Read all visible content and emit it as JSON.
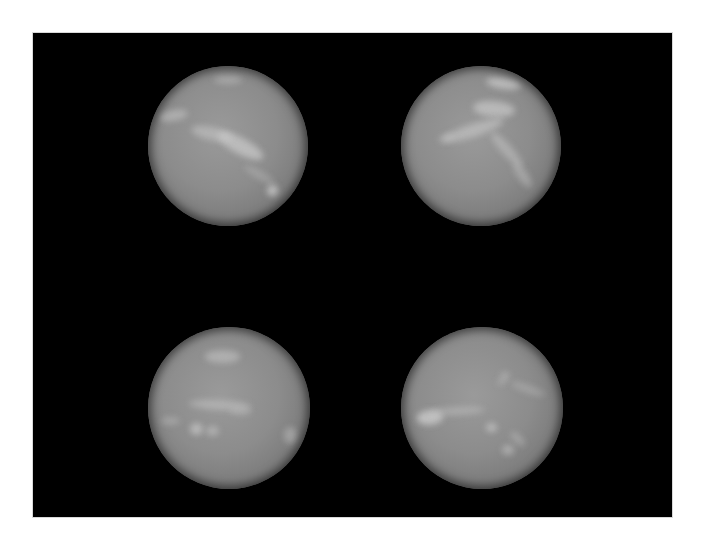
{
  "image": {
    "alt": "Four grayscale telescope images of Neptune arranged in a 2x2 grid on a black background, showing bright cloud bands and features",
    "background_color": "#ffffff",
    "panel_color": "#000000",
    "planet_base_color": "#8c8c8c",
    "feature_color": "#c8c8c8"
  },
  "panels": [
    {
      "id": "top-left",
      "cx": 228,
      "cy": 146,
      "r": 80,
      "features": [
        {
          "x": 0.58,
          "y": 0.5,
          "w": 0.32,
          "h": 0.1,
          "rot": 28,
          "o": 0.75
        },
        {
          "x": 0.4,
          "y": 0.42,
          "w": 0.26,
          "h": 0.08,
          "rot": 12,
          "o": 0.55
        },
        {
          "x": 0.16,
          "y": 0.31,
          "w": 0.18,
          "h": 0.07,
          "rot": -10,
          "o": 0.55
        },
        {
          "x": 0.5,
          "y": 0.09,
          "w": 0.18,
          "h": 0.05,
          "rot": 0,
          "o": 0.45
        },
        {
          "x": 0.78,
          "y": 0.78,
          "w": 0.07,
          "h": 0.07,
          "rot": 0,
          "o": 0.85
        },
        {
          "x": 0.7,
          "y": 0.68,
          "w": 0.22,
          "h": 0.05,
          "rot": 30,
          "o": 0.35
        }
      ]
    },
    {
      "id": "top-right",
      "cx": 481,
      "cy": 146,
      "r": 80,
      "features": [
        {
          "x": 0.64,
          "y": 0.11,
          "w": 0.22,
          "h": 0.07,
          "rot": 8,
          "o": 0.75
        },
        {
          "x": 0.58,
          "y": 0.27,
          "w": 0.26,
          "h": 0.1,
          "rot": 5,
          "o": 0.7
        },
        {
          "x": 0.45,
          "y": 0.4,
          "w": 0.4,
          "h": 0.08,
          "rot": -18,
          "o": 0.6
        },
        {
          "x": 0.66,
          "y": 0.52,
          "w": 0.28,
          "h": 0.07,
          "rot": 48,
          "o": 0.5
        },
        {
          "x": 0.76,
          "y": 0.68,
          "w": 0.18,
          "h": 0.06,
          "rot": 55,
          "o": 0.45
        },
        {
          "x": 0.28,
          "y": 0.45,
          "w": 0.1,
          "h": 0.05,
          "rot": -20,
          "o": 0.4
        }
      ]
    },
    {
      "id": "bottom-left",
      "cx": 229,
      "cy": 408,
      "r": 81,
      "features": [
        {
          "x": 0.46,
          "y": 0.18,
          "w": 0.22,
          "h": 0.08,
          "rot": 0,
          "o": 0.55
        },
        {
          "x": 0.44,
          "y": 0.48,
          "w": 0.38,
          "h": 0.06,
          "rot": 3,
          "o": 0.5
        },
        {
          "x": 0.57,
          "y": 0.52,
          "w": 0.14,
          "h": 0.05,
          "rot": 0,
          "o": 0.4
        },
        {
          "x": 0.3,
          "y": 0.63,
          "w": 0.08,
          "h": 0.07,
          "rot": 0,
          "o": 0.7
        },
        {
          "x": 0.4,
          "y": 0.64,
          "w": 0.08,
          "h": 0.06,
          "rot": 0,
          "o": 0.55
        },
        {
          "x": 0.14,
          "y": 0.58,
          "w": 0.12,
          "h": 0.05,
          "rot": 0,
          "o": 0.4
        },
        {
          "x": 0.88,
          "y": 0.67,
          "w": 0.08,
          "h": 0.1,
          "rot": 0,
          "o": 0.45
        }
      ]
    },
    {
      "id": "bottom-right",
      "cx": 482,
      "cy": 408,
      "r": 81,
      "features": [
        {
          "x": 0.18,
          "y": 0.56,
          "w": 0.16,
          "h": 0.09,
          "rot": -5,
          "o": 0.85
        },
        {
          "x": 0.35,
          "y": 0.52,
          "w": 0.34,
          "h": 0.05,
          "rot": -3,
          "o": 0.45
        },
        {
          "x": 0.56,
          "y": 0.62,
          "w": 0.07,
          "h": 0.06,
          "rot": 0,
          "o": 0.7
        },
        {
          "x": 0.66,
          "y": 0.76,
          "w": 0.07,
          "h": 0.06,
          "rot": 0,
          "o": 0.55
        },
        {
          "x": 0.72,
          "y": 0.69,
          "w": 0.12,
          "h": 0.05,
          "rot": 45,
          "o": 0.4
        },
        {
          "x": 0.64,
          "y": 0.3,
          "w": 0.06,
          "h": 0.05,
          "rot": 0,
          "o": 0.45
        },
        {
          "x": 0.78,
          "y": 0.38,
          "w": 0.22,
          "h": 0.05,
          "rot": 20,
          "o": 0.35
        },
        {
          "x": 0.62,
          "y": 0.34,
          "w": 0.06,
          "h": 0.04,
          "rot": 0,
          "o": 0.4
        }
      ]
    }
  ]
}
